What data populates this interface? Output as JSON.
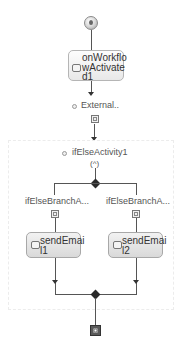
{
  "workflow": {
    "start": {
      "icon": "start-icon"
    },
    "activities": [
      {
        "id": "onWorkflowActivated1",
        "label_lines": [
          "onWorkflo",
          "wActivate",
          "d1"
        ],
        "icon": "event-icon"
      },
      {
        "id": "External",
        "label": "External..",
        "icon": "external-icon"
      }
    ],
    "ifelse": {
      "label": "ifElseActivity1",
      "branches": [
        {
          "label": "ifElseBranchA...",
          "activity": {
            "label_lines": [
              "sendEmai",
              "l1"
            ],
            "icon": "email-icon"
          }
        },
        {
          "label": "ifElseBranchA...",
          "activity": {
            "label_lines": [
              "sendEmai",
              "l2"
            ],
            "icon": "email-icon"
          }
        }
      ]
    },
    "end": {
      "icon": "end-icon"
    }
  }
}
